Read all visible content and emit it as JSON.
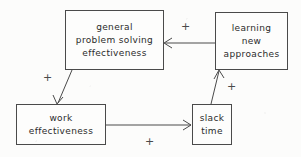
{
  "diagram": {
    "type": "causal-loop",
    "background_color": "#fcfcfb",
    "line_color": "#4a4a4a",
    "text_color": "#2b2b2b",
    "nodes": [
      {
        "id": "general-problem-solving-effectiveness",
        "lines": [
          "general",
          "problem solving",
          "effectiveness"
        ],
        "x": 65,
        "y": 10,
        "w": 99,
        "h": 60
      },
      {
        "id": "learning-new-approaches",
        "lines": [
          "learning",
          "new",
          "approaches"
        ],
        "x": 215,
        "y": 12,
        "w": 73,
        "h": 58
      },
      {
        "id": "work-effectiveness",
        "lines": [
          "work",
          "effectiveness"
        ],
        "x": 16,
        "y": 104,
        "w": 90,
        "h": 41
      },
      {
        "id": "slack-time",
        "lines": [
          "slack",
          "time"
        ],
        "x": 192,
        "y": 104,
        "w": 40,
        "h": 41
      }
    ],
    "edges": [
      {
        "id": "learning-to-problem-solving",
        "from": "learning-new-approaches",
        "to": "general-problem-solving-effectiveness",
        "polarity": "+",
        "label_x": 181,
        "label_y": 21
      },
      {
        "id": "problem-solving-to-work",
        "from": "general-problem-solving-effectiveness",
        "to": "work-effectiveness",
        "polarity": "+",
        "label_x": 43,
        "label_y": 72
      },
      {
        "id": "work-to-slack",
        "from": "work-effectiveness",
        "to": "slack-time",
        "polarity": "+",
        "label_x": 145,
        "label_y": 136
      },
      {
        "id": "slack-to-learning",
        "from": "slack-time",
        "to": "learning-new-approaches",
        "polarity": "+",
        "label_x": 227,
        "label_y": 81
      }
    ]
  }
}
